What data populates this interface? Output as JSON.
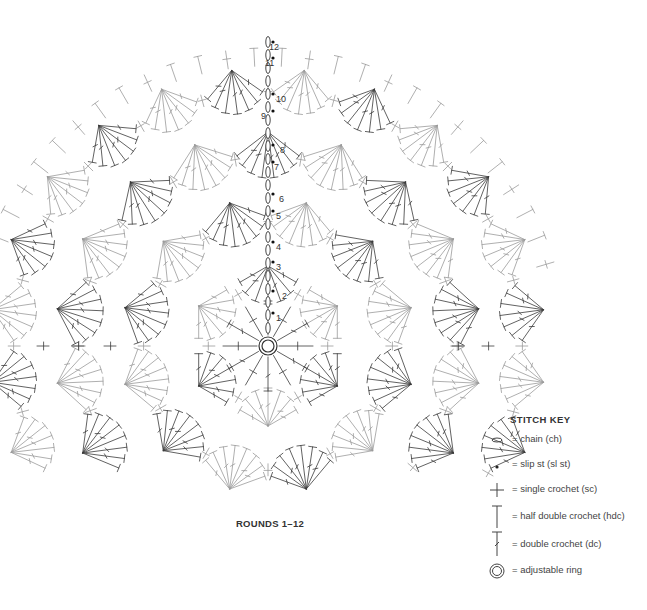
{
  "diagram": {
    "type": "crochet-chart",
    "shape": "circle",
    "center": [
      268,
      346
    ],
    "caption": "ROUNDS 1–12",
    "line_colors": {
      "dark": "#3a3a3a",
      "light": "#9a9a9a"
    },
    "round_labels": [
      {
        "n": "1",
        "x": 276,
        "y": 321
      },
      {
        "n": "2",
        "x": 282,
        "y": 299
      },
      {
        "n": "3",
        "x": 276,
        "y": 270
      },
      {
        "n": "4",
        "x": 276,
        "y": 250
      },
      {
        "n": "5",
        "x": 276,
        "y": 219
      },
      {
        "n": "6",
        "x": 279,
        "y": 202
      },
      {
        "n": "7",
        "x": 274,
        "y": 170
      },
      {
        "n": "8",
        "x": 280,
        "y": 153
      },
      {
        "n": "9",
        "x": 261,
        "y": 119
      },
      {
        "n": "10",
        "x": 276,
        "y": 102
      },
      {
        "n": "11",
        "x": 265,
        "y": 66
      },
      {
        "n": "12",
        "x": 269,
        "y": 50
      }
    ],
    "rings": [
      {
        "round": "2-4",
        "radius": 80,
        "fans": 6,
        "fan_radius": 38,
        "stitches": 7,
        "spread": 120
      },
      {
        "round": "5-7",
        "radius": 148,
        "fans": 12,
        "fan_radius": 44,
        "stitches": 8,
        "spread": 110
      },
      {
        "round": "8-10",
        "radius": 214,
        "fans": 18,
        "fan_radius": 46,
        "stitches": 8,
        "spread": 105
      },
      {
        "round": "11-12",
        "radius": 278,
        "fans": 24,
        "fan_radius": 44,
        "stitches": 7,
        "spread": 95
      }
    ]
  },
  "stitch_key": {
    "title": "STITCH KEY",
    "items": [
      {
        "symbol": "chain-icon",
        "label": "= chain (ch)"
      },
      {
        "symbol": "slip-stitch-icon",
        "label": "= slip st (sl st)"
      },
      {
        "symbol": "single-crochet-icon",
        "label": "= single crochet (sc)"
      },
      {
        "symbol": "half-double-crochet-icon",
        "label": "= half double crochet (hdc)"
      },
      {
        "symbol": "double-crochet-icon",
        "label": "= double crochet (dc)"
      },
      {
        "symbol": "adjustable-ring-icon",
        "label": "= adjustable ring"
      }
    ]
  }
}
